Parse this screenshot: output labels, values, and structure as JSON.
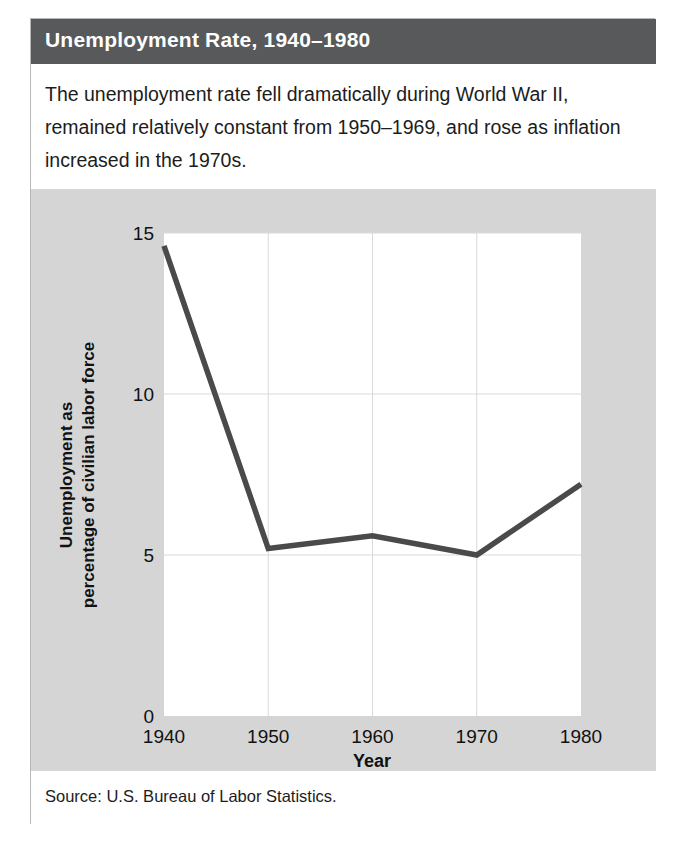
{
  "header": {
    "title": "Unemployment Rate, 1940–1980"
  },
  "caption": {
    "text": "The unemployment rate fell dramatically during World War II, remained relatively constant from 1950–1969, and rose as inflation increased in the 1970s."
  },
  "footer": {
    "source": "Source: U.S. Bureau of Labor Statistics."
  },
  "colors": {
    "header_bg": "#58595b",
    "panel_bg": "#d5d5d5",
    "plot_bg": "#ffffff",
    "line": "#4a4a4a",
    "grid": "#d9d9d9",
    "text": "#111111"
  },
  "axis_title": {
    "y_line1": "Unemployment as",
    "y_line2": "percentage of civilian labor force",
    "x": "Year"
  },
  "chart_data": {
    "type": "line",
    "title": "Unemployment Rate, 1940–1980",
    "xlabel": "Year",
    "ylabel": "Unemployment as percentage of civilian labor force",
    "xlim": [
      1940,
      1980
    ],
    "ylim": [
      0,
      15
    ],
    "xticks": [
      1940,
      1950,
      1960,
      1970,
      1980
    ],
    "xtick_labels": [
      "1940",
      "1950",
      "1960",
      "1970",
      "1980"
    ],
    "yticks": [
      0,
      5,
      10,
      15
    ],
    "ytick_labels": [
      "0",
      "5",
      "10",
      "15"
    ],
    "grid": true,
    "legend": "none",
    "x": [
      1940,
      1950,
      1960,
      1970,
      1980
    ],
    "values": [
      14.6,
      5.2,
      5.6,
      5.0,
      7.2
    ],
    "series": [
      {
        "name": "Unemployment rate",
        "values": [
          14.6,
          5.2,
          5.6,
          5.0,
          7.2
        ]
      }
    ]
  }
}
